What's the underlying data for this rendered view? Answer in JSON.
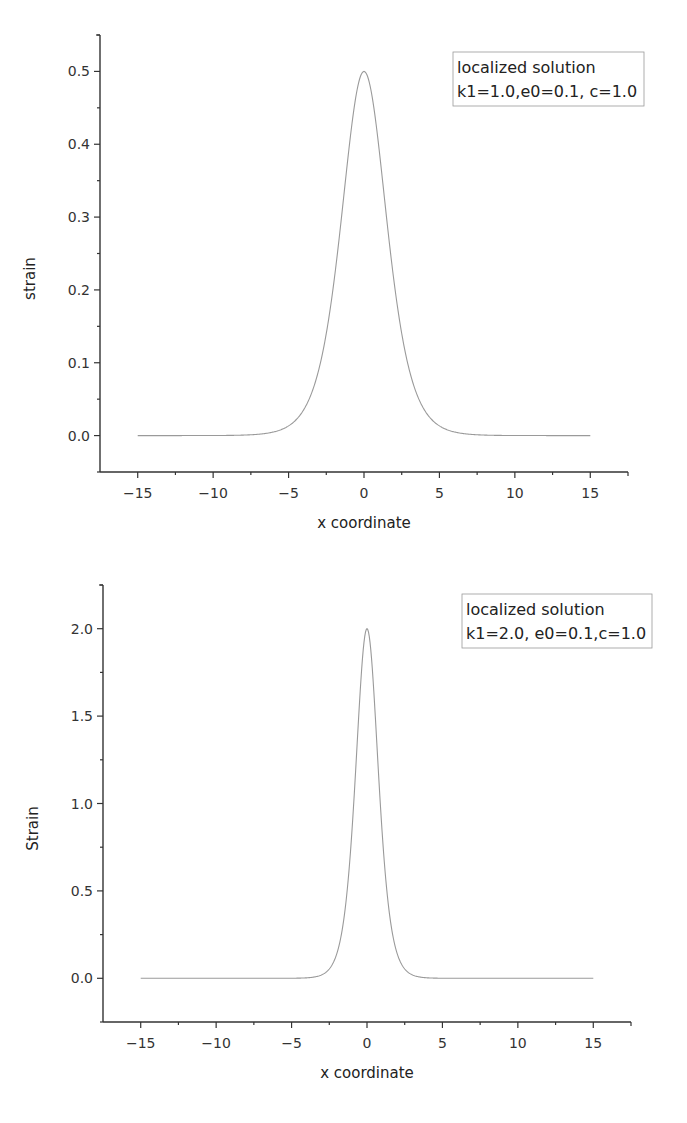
{
  "chart_data": [
    {
      "type": "line",
      "title": "",
      "xlabel": "x coordinate",
      "ylabel": "strain",
      "xlim": [
        -17.5,
        17.5
      ],
      "ylim": [
        -0.05,
        0.55
      ],
      "xticks": [
        -15,
        -10,
        -5,
        0,
        5,
        10,
        15
      ],
      "xtick_labels": [
        "−15",
        "−10",
        "−5",
        "0",
        "5",
        "10",
        "15"
      ],
      "yticks": [
        0.0,
        0.1,
        0.2,
        0.3,
        0.4,
        0.5
      ],
      "ytick_labels": [
        "0.0",
        "0.1",
        "0.2",
        "0.3",
        "0.4",
        "0.5"
      ],
      "grid": false,
      "legend_position": "upper right",
      "legend": [
        "localized solution",
        "k1=1.0,e0=0.1, c=1.0"
      ],
      "series": [
        {
          "name": "localized solution",
          "x": [
            -15,
            -10,
            -7,
            -5,
            -4,
            -3,
            -2,
            -1.5,
            -1,
            -0.5,
            0,
            0.5,
            1,
            1.5,
            2,
            3,
            4,
            5,
            7,
            10,
            15
          ],
          "values": [
            0.0,
            0.0,
            0.001,
            0.013,
            0.035,
            0.09,
            0.21,
            0.29,
            0.393,
            0.47,
            0.5,
            0.47,
            0.393,
            0.29,
            0.21,
            0.09,
            0.035,
            0.013,
            0.001,
            0.0,
            0.0
          ]
        }
      ]
    },
    {
      "type": "line",
      "title": "",
      "xlabel": "x coordinate",
      "ylabel": "Strain",
      "xlim": [
        -17.5,
        17.5
      ],
      "ylim": [
        -0.25,
        2.25
      ],
      "xticks": [
        -15,
        -10,
        -5,
        0,
        5,
        10,
        15
      ],
      "xtick_labels": [
        "−15",
        "−10",
        "−5",
        "0",
        "5",
        "10",
        "15"
      ],
      "yticks": [
        0.0,
        0.5,
        1.0,
        1.5,
        2.0
      ],
      "ytick_labels": [
        "0.0",
        "0.5",
        "1.0",
        "1.5",
        "2.0"
      ],
      "grid": false,
      "legend_position": "upper right",
      "legend": [
        "localized solution",
        "k1=2.0, e0=0.1,c=1.0"
      ],
      "series": [
        {
          "name": "localized solution",
          "x": [
            -15,
            -10,
            -5,
            -3,
            -2,
            -1.5,
            -1,
            -0.5,
            0,
            0.5,
            1,
            1.5,
            2,
            3,
            5,
            10,
            15
          ],
          "values": [
            0.0,
            0.0,
            0.0,
            0.02,
            0.14,
            0.3,
            0.84,
            1.57,
            2.0,
            1.57,
            0.84,
            0.3,
            0.14,
            0.02,
            0.0,
            0.0,
            0.0
          ]
        }
      ]
    }
  ],
  "charts": [
    {
      "frame": {
        "left": 100,
        "top": 35,
        "right": 628,
        "bottom": 472
      },
      "ylabel": "strain",
      "xlabel": "x coordinate",
      "legend": {
        "line1": "localized solution",
        "line2": "k1=1.0,e0=0.1, c=1.0",
        "x": 453,
        "y": 52,
        "w": 191,
        "h": 54
      },
      "amplitude": 0.5,
      "width": 2.0
    },
    {
      "frame": {
        "left": 103,
        "top": 585,
        "right": 631,
        "bottom": 1022
      },
      "ylabel": "Strain",
      "xlabel": "x coordinate",
      "legend": {
        "line1": "localized solution",
        "line2": "k1=2.0, e0=0.1,c=1.0",
        "x": 462,
        "y": 594,
        "w": 190,
        "h": 54
      },
      "amplitude": 2.0,
      "width": 1.0
    }
  ],
  "colors": {
    "curve": "#9a9a9a",
    "axis": "#333333"
  }
}
